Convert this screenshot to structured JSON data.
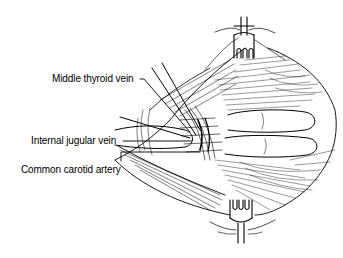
{
  "figure": {
    "type": "surgical-anatomy-illustration",
    "background": "#ffffff",
    "ink": "#000000"
  },
  "labels": [
    {
      "id": "middle-thyroid-vein",
      "text": "Middle thyroid vein"
    },
    {
      "id": "internal-jugular-vein",
      "text": "Internal jugular vein"
    },
    {
      "id": "common-carotid-artery",
      "text": "Common carotid artery"
    }
  ],
  "instruments": [
    {
      "id": "top-retractor",
      "icon": "retractor-icon"
    },
    {
      "id": "bottom-retractor",
      "icon": "retractor-icon"
    }
  ]
}
